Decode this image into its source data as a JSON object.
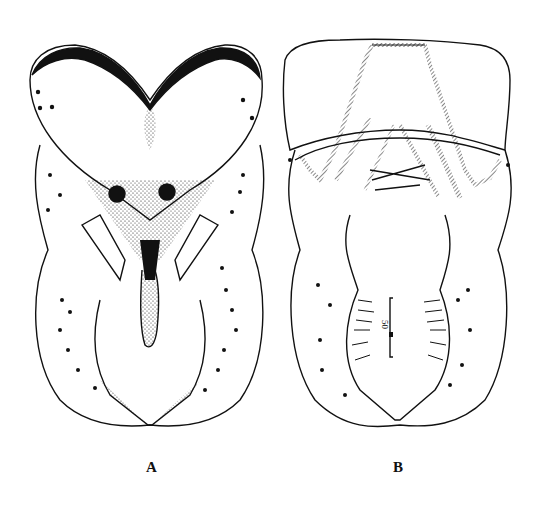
{
  "figure": {
    "panels": [
      {
        "label": "A",
        "view": "ventral view with dorsal sclerite stippling"
      },
      {
        "label": "B",
        "view": "dorsal view with hatched sclerites"
      }
    ],
    "scale_bar": {
      "value": "50",
      "unit": "µm",
      "text": "50 µm"
    }
  }
}
